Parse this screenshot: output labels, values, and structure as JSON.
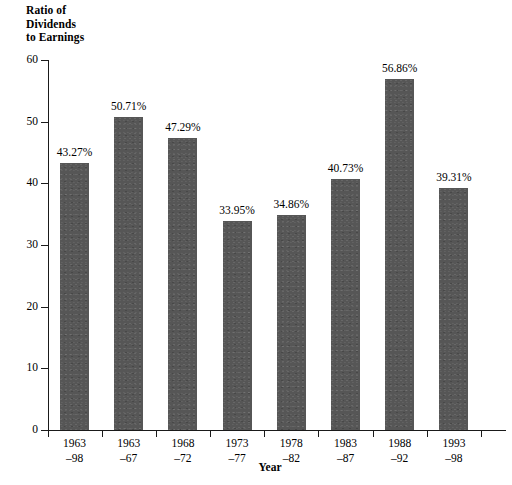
{
  "chart_data": {
    "type": "bar",
    "title": "",
    "ylabel": "Ratio of\nDividends\nto Earnings",
    "ylabel_lines": [
      "Ratio of",
      "Dividends",
      "to Earnings"
    ],
    "xlabel": "Year",
    "ylim": [
      0,
      60
    ],
    "ytick_labels": [
      "60",
      "50",
      "40",
      "30",
      "20",
      "10",
      "0"
    ],
    "yticks": [
      60,
      50,
      40,
      30,
      20,
      10,
      0
    ],
    "grid": false,
    "legend": null,
    "bar_color": "#565656",
    "axis_color": "#1a1a1a",
    "categories": [
      "1963\n-98",
      "1963\n-67",
      "1968\n-72",
      "1973\n-77",
      "1978\n-82",
      "1983\n-87",
      "1988\n-92",
      "1993\n-98"
    ],
    "category_lines": [
      [
        "1963",
        "–98"
      ],
      [
        "1963",
        "–67"
      ],
      [
        "1968",
        "–72"
      ],
      [
        "1973",
        "–77"
      ],
      [
        "1978",
        "–82"
      ],
      [
        "1983",
        "–87"
      ],
      [
        "1988",
        "–92"
      ],
      [
        "1993",
        "–98"
      ]
    ],
    "values": [
      43.27,
      50.71,
      47.29,
      33.95,
      34.86,
      40.73,
      56.86,
      39.31
    ],
    "data_labels": [
      "43.27%",
      "50.71%",
      "47.29%",
      "33.95%",
      "34.86%",
      "40.73%",
      "56.86%",
      "39.31%"
    ]
  }
}
